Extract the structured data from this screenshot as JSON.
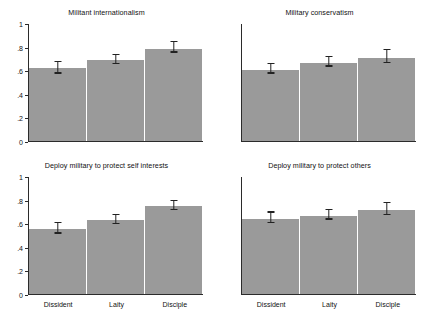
{
  "chart_data": {
    "type": "bar",
    "title": "",
    "layout": "2x2 faceted panels",
    "categories": [
      "Dissident",
      "Laity",
      "Disciple"
    ],
    "xlabel": "",
    "ylabel": "",
    "ylim": [
      0,
      1
    ],
    "yticks": [
      "0",
      ".2",
      ".4",
      ".6",
      ".8",
      "1"
    ],
    "ytick_values": [
      0,
      0.2,
      0.4,
      0.6,
      0.8,
      1
    ],
    "grid": false,
    "legend": "none",
    "error_bars": "95% confidence intervals",
    "bar_color": "#9a9a9a",
    "panels": [
      {
        "position": "top-left",
        "title": "Militant internationalism",
        "values": [
          0.62,
          0.69,
          0.79
        ],
        "err_low": [
          0.575,
          0.655,
          0.755
        ],
        "err_high": [
          0.675,
          0.735,
          0.845
        ]
      },
      {
        "position": "top-right",
        "title": "Military conservatism",
        "values": [
          0.61,
          0.67,
          0.71
        ],
        "err_low": [
          0.575,
          0.635,
          0.665
        ],
        "err_high": [
          0.655,
          0.715,
          0.775
        ]
      },
      {
        "position": "bottom-left",
        "title": "Deploy military to protect self interests",
        "values": [
          0.555,
          0.635,
          0.755
        ],
        "err_low": [
          0.515,
          0.595,
          0.715
        ],
        "err_high": [
          0.605,
          0.675,
          0.795
        ]
      },
      {
        "position": "bottom-right",
        "title": "Deploy military to protect others",
        "values": [
          0.645,
          0.67,
          0.715
        ],
        "err_low": [
          0.605,
          0.635,
          0.675
        ],
        "err_high": [
          0.695,
          0.715,
          0.775
        ]
      }
    ]
  },
  "panels": {
    "tl": {
      "title": "Militant internationalism"
    },
    "tr": {
      "title": "Military conservatism"
    },
    "bl": {
      "title": "Deploy military to protect self interests"
    },
    "br": {
      "title": "Deploy military to protect others"
    }
  },
  "axis": {
    "yticks": [
      "1",
      ".8",
      ".6",
      ".4",
      ".2",
      "0"
    ],
    "xticks": [
      "Dissident",
      "Laity",
      "Disciple"
    ]
  }
}
